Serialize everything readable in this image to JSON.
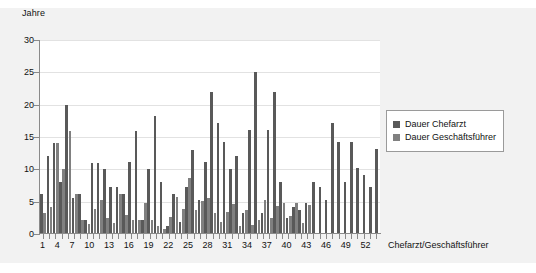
{
  "chart_data": {
    "type": "bar",
    "title": "",
    "ylabel": "Jahre",
    "xlabel": "Chefarzt/Geschäftsführer",
    "ylim": [
      0,
      30
    ],
    "yticks": [
      0,
      5,
      10,
      15,
      20,
      25,
      30
    ],
    "grid": true,
    "legend_position": "right",
    "series": [
      {
        "name": "Dauer Chefarzt",
        "color": "#595959",
        "values": [
          6.2,
          12.1,
          14.1,
          8.1,
          20.0,
          5.5,
          6.2,
          2.2,
          11.0,
          11.0,
          10.1,
          7.2,
          7.2,
          6.2,
          11.1,
          16.0,
          2.2,
          10.1,
          18.2,
          8.1,
          1.2,
          6.2,
          1.8,
          7.2,
          13.0,
          5.2,
          11.1,
          22.0,
          17.2,
          14.2,
          10.1,
          12.1,
          3.3,
          16.1,
          25.1,
          3.3,
          16.1,
          22.0,
          8.1,
          2.4,
          4.2,
          3.7,
          4.8,
          8.1,
          7.2,
          5.2,
          17.2,
          14.2,
          8.1,
          14.2,
          10.2,
          9.1,
          7.2,
          13.1
        ]
      },
      {
        "name": "Dauer Geschäftsführer",
        "color": "#808080",
        "values": [
          3.3,
          4.2,
          14.1,
          10.1,
          16.0,
          6.2,
          2.2,
          1.5,
          3.8,
          5.2,
          2.5,
          1.7,
          6.2,
          3.0,
          2.2,
          2.2,
          4.8,
          2.2,
          1.2,
          0.7,
          2.6,
          5.7,
          3.8,
          8.7,
          3.7,
          5.1,
          5.6,
          3.3,
          1.8,
          3.4,
          4.6,
          1.3,
          3.7,
          1.4,
          2.2,
          5.2,
          2.4,
          4.3,
          4.8,
          2.8,
          4.8,
          1.7,
          4.5,
          0,
          0,
          0,
          0,
          0,
          0,
          0,
          0,
          0,
          0,
          0
        ]
      }
    ],
    "categories": [
      1,
      2,
      3,
      4,
      5,
      6,
      7,
      8,
      9,
      10,
      11,
      12,
      13,
      14,
      15,
      16,
      17,
      18,
      19,
      20,
      21,
      22,
      23,
      24,
      25,
      26,
      27,
      28,
      29,
      30,
      31,
      32,
      33,
      34,
      35,
      36,
      37,
      38,
      39,
      40,
      41,
      42,
      43,
      44,
      45,
      46,
      47,
      48,
      49,
      50,
      51,
      52,
      53,
      54
    ],
    "xtick_labels": [
      "1",
      "",
      "",
      "4",
      "",
      "",
      "7",
      "",
      "",
      "10",
      "",
      "",
      "13",
      "",
      "",
      "16",
      "",
      "",
      "19",
      "",
      "",
      "22",
      "",
      "",
      "25",
      "",
      "",
      "28",
      "",
      "",
      "31",
      "",
      "",
      "34",
      "",
      "",
      "37",
      "",
      "",
      "40",
      "",
      "",
      "43",
      "",
      "",
      "46",
      "",
      "",
      "49",
      "",
      "",
      "52",
      "",
      ""
    ]
  },
  "legend": {
    "items": [
      {
        "label": "Dauer Chefarzt",
        "color": "#595959"
      },
      {
        "label": "Dauer Geschäftsführer",
        "color": "#808080"
      }
    ]
  },
  "axis": {
    "y_title": "Jahre",
    "x_title": "Chefarzt/Geschäftsführer",
    "y_tick_labels": [
      "30",
      "25",
      "20",
      "15",
      "10",
      "5",
      "0"
    ]
  },
  "colors": {
    "series1": "#595959",
    "series2": "#808080",
    "background": "#f2f2f2",
    "plot_background": "#ffffff",
    "axis": "#8a8a8a",
    "grid": "#e2e2e2"
  }
}
